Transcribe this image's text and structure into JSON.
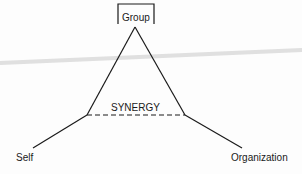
{
  "diagram": {
    "nodes": {
      "top": "Group",
      "left": "Self",
      "right": "Organization"
    },
    "center_label": "SYNERGY",
    "colors": {
      "ink": "#1a1a1a",
      "smear": "#d8d8d8",
      "background": "#fdfdfd"
    }
  }
}
